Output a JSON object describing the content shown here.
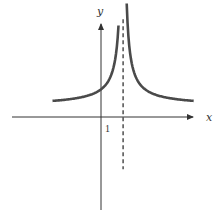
{
  "chart_data": {
    "type": "line",
    "title": "",
    "xlabel": "x",
    "ylabel": "y",
    "function": "y = 1/|x - 1|",
    "vertical_asymptote": {
      "x": 1,
      "style": "dashed"
    },
    "horizontal_asymptote": {
      "y": 0
    },
    "xlim": [
      -6.5,
      6.6
    ],
    "ylim": [
      -4.6,
      4.7
    ],
    "x_tick_labels": [
      {
        "value": 1,
        "label": "1"
      }
    ],
    "series": [
      {
        "name": "left-branch",
        "x_range": [
          -3.3,
          0.72
        ],
        "description": "increasing toward +infinity as x approaches 1 from the left"
      },
      {
        "name": "right-branch",
        "x_range": [
          1.22,
          5.3
        ],
        "description": "decreasing toward 0 as x increases from 1"
      }
    ],
    "y_intercept": 1,
    "grid": false,
    "legend": "none",
    "colors": {
      "curve": "#4a4a4a",
      "axes": "#333333",
      "asymptote": "#333333"
    }
  }
}
